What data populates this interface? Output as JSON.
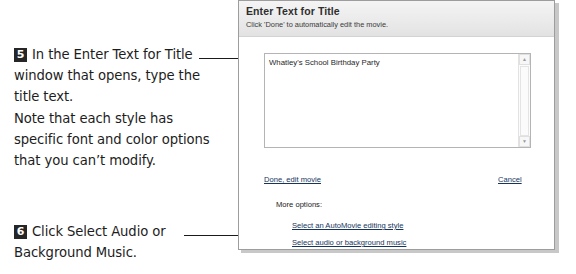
{
  "instructions": {
    "steps": [
      {
        "number": "5",
        "text": "In the Enter Text for Title window that opens, type the title text."
      },
      {
        "number": "6",
        "text": "Click Select Audio or Background Music."
      }
    ],
    "note": "Note that each style has specific font and color options that you can’t modify."
  },
  "panel": {
    "title": "Enter Text for Title",
    "subtitle": "Click 'Done' to automatically edit the movie.",
    "textarea": {
      "value": "Whatley's School Birthday Party",
      "scrollbar": {
        "up_icon": "▲",
        "down_icon": "▼"
      }
    },
    "links": {
      "done": "Done, edit movie",
      "cancel": "Cancel",
      "more_options_label": "More options:",
      "editing_style": "Select an AutoMovie editing style",
      "audio": "Select audio or background music"
    }
  },
  "colors": {
    "badge_bg": "#262626",
    "link": "#15355e",
    "panel_border": "#9d9d9d",
    "leader_line": "#1a1a1a"
  }
}
